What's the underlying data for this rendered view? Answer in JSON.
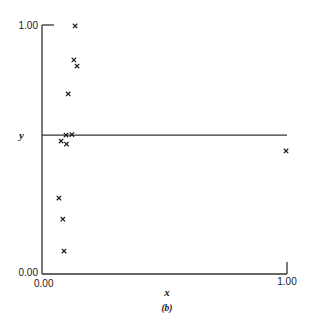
{
  "chart_data": {
    "type": "scatter",
    "title": "",
    "caption": "(b)",
    "xlabel": "x",
    "ylabel": "y",
    "xlim": [
      0.0,
      1.0
    ],
    "ylim": [
      0.0,
      1.0
    ],
    "x_tick_labels": [
      "0.00",
      "1.00"
    ],
    "y_tick_labels": [
      "0.00",
      "1.00"
    ],
    "grid": false,
    "legend": null,
    "marker": "x",
    "reference_line": {
      "type": "horizontal",
      "y": 0.558
    },
    "points": [
      {
        "x": 0.135,
        "y": 0.996
      },
      {
        "x": 0.13,
        "y": 0.86
      },
      {
        "x": 0.143,
        "y": 0.835
      },
      {
        "x": 0.107,
        "y": 0.723
      },
      {
        "x": 0.098,
        "y": 0.558
      },
      {
        "x": 0.122,
        "y": 0.56
      },
      {
        "x": 0.078,
        "y": 0.534
      },
      {
        "x": 0.1,
        "y": 0.522
      },
      {
        "x": 0.069,
        "y": 0.305
      },
      {
        "x": 0.085,
        "y": 0.22
      },
      {
        "x": 0.09,
        "y": 0.092
      },
      {
        "x": 0.996,
        "y": 0.494
      }
    ]
  },
  "labels": {
    "y_top": "1.00",
    "y_bottom": "0.00",
    "x_left": "0.00",
    "x_right": "1.00",
    "x_axis": "x",
    "y_axis": "y",
    "caption": "(b)",
    "marker_glyph": "×"
  }
}
